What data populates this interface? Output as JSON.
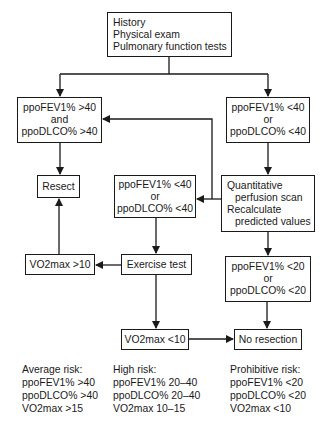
{
  "nodes": {
    "start": {
      "lines": [
        "History",
        "Physical exam",
        "Pulmonary function tests"
      ]
    },
    "good_pft": {
      "lines": [
        "ppoFEV1% >40",
        "and",
        "ppoDLCO% >40"
      ]
    },
    "low_pft": {
      "lines": [
        "ppoFEV1% <40",
        "or",
        "ppoDLCO% <40"
      ]
    },
    "resect": {
      "label": "Resect"
    },
    "low_pft_recalc": {
      "lines": [
        "ppoFEV1% <40",
        "or",
        "ppoDLCO% <40"
      ]
    },
    "quant_scan": {
      "lines": [
        "Quantitative",
        "perfusion scan",
        "Recalculate",
        "predicted values"
      ]
    },
    "vo2_high": {
      "label": "VO2max >10"
    },
    "exercise": {
      "label": "Exercise test"
    },
    "very_low_pft": {
      "lines": [
        "ppoFEV1% <20",
        "or",
        "ppoDLCO% <20"
      ]
    },
    "vo2_low": {
      "label": "VO2max <10"
    },
    "no_resection": {
      "label": "No resection"
    }
  },
  "legend": [
    {
      "title": "Average risk:",
      "lines": [
        "ppoFEV1% >40",
        "ppoDLCO% >40",
        "VO2max >15"
      ]
    },
    {
      "title": "High risk:",
      "lines": [
        "ppoFEV1% 20–40",
        "ppoDLCO% 20–40",
        "VO2max 10–15"
      ]
    },
    {
      "title": "Prohibitive risk:",
      "lines": [
        "ppoFEV1% <20",
        "ppoDLCO% <20",
        "VO2max <10"
      ]
    }
  ]
}
